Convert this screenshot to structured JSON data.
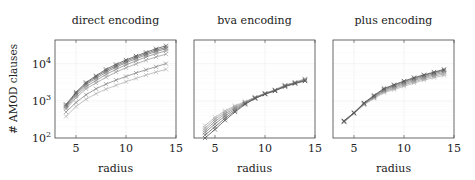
{
  "chart_data": [
    {
      "type": "line",
      "title": "direct encoding",
      "xlabel": "radius",
      "ylabel": "# AMOD clauses",
      "yscale": "log",
      "xlim": [
        2.9,
        15
      ],
      "ylim": [
        100,
        43000
      ],
      "xticks": [
        5,
        10,
        15
      ],
      "yticks": [
        100,
        1000,
        10000
      ],
      "ytick_labels": [
        "10",
        "10",
        "10"
      ],
      "ytick_exponents": [
        "2",
        "3",
        "4"
      ],
      "grid": true,
      "marker": "x",
      "x": [
        4,
        5,
        6,
        7,
        8,
        9,
        10,
        11,
        12,
        13,
        14
      ],
      "series": [
        {
          "name": "s1",
          "color": "#555555",
          "values": [
            800,
            1700,
            3100,
            4700,
            7000,
            9500,
            12500,
            16000,
            20000,
            25000,
            30000
          ]
        },
        {
          "name": "s2",
          "color": "#6a6a6a",
          "values": [
            750,
            1600,
            2900,
            4400,
            6400,
            8700,
            11500,
            14800,
            18500,
            23000,
            27000
          ]
        },
        {
          "name": "s3",
          "color": "#7d7d7d",
          "values": [
            700,
            1500,
            2700,
            4000,
            5800,
            8000,
            10500,
            13500,
            17000,
            21000,
            25000
          ]
        },
        {
          "name": "s4",
          "color": "#8f8f8f",
          "values": [
            650,
            1350,
            2400,
            3500,
            5100,
            7000,
            9200,
            11800,
            15000,
            18500,
            22000
          ]
        },
        {
          "name": "s5",
          "color": "#a0a0a0",
          "values": [
            600,
            1200,
            2100,
            3000,
            4300,
            5900,
            7700,
            9800,
            12300,
            15000,
            18000
          ]
        },
        {
          "name": "s6",
          "color": "#8a8a8a",
          "values": [
            500,
            900,
            1450,
            2100,
            2800,
            3600,
            4500,
            5600,
            6800,
            8200,
            10000
          ]
        },
        {
          "name": "s7",
          "color": "#b4b4b4",
          "values": [
            380,
            700,
            1100,
            1550,
            2050,
            2600,
            3250,
            4000,
            4900,
            5900,
            7000
          ]
        }
      ]
    },
    {
      "type": "line",
      "title": "bva encoding",
      "xlabel": "radius",
      "ylabel": "",
      "yscale": "log",
      "xlim": [
        2.9,
        15
      ],
      "ylim": [
        100,
        43000
      ],
      "xticks": [
        5,
        10,
        15
      ],
      "yticks": [
        100,
        1000,
        10000
      ],
      "grid": true,
      "marker": "x",
      "x": [
        4,
        5,
        6,
        7,
        8,
        9,
        10,
        11,
        12,
        13,
        14
      ],
      "series": [
        {
          "name": "s1",
          "color": "#555555",
          "values": [
            100,
            170,
            300,
            500,
            800,
            1150,
            1500,
            1850,
            2400,
            2900,
            3400
          ]
        },
        {
          "name": "s2",
          "color": "#6a6a6a",
          "values": [
            120,
            200,
            340,
            540,
            830,
            1170,
            1520,
            1880,
            2450,
            2950,
            3500
          ]
        },
        {
          "name": "s3",
          "color": "#7d7d7d",
          "values": [
            140,
            240,
            390,
            590,
            860,
            1190,
            1540,
            1900,
            2500,
            3000,
            3600
          ]
        },
        {
          "name": "s4",
          "color": "#8f8f8f",
          "values": [
            160,
            280,
            440,
            640,
            890,
            1210,
            1560,
            1920,
            2550,
            3050,
            3700
          ]
        },
        {
          "name": "s5",
          "color": "#a0a0a0",
          "values": [
            185,
            320,
            490,
            690,
            920,
            1230,
            1580,
            1950,
            2600,
            3100,
            3800
          ]
        },
        {
          "name": "s6",
          "color": "#b4b4b4",
          "values": [
            215,
            360,
            540,
            740,
            950,
            1250,
            1600,
            1970,
            2650,
            3150,
            3900
          ]
        }
      ]
    },
    {
      "type": "line",
      "title": "plus encoding",
      "xlabel": "radius",
      "ylabel": "",
      "yscale": "log",
      "xlim": [
        2.9,
        15
      ],
      "ylim": [
        100,
        43000
      ],
      "xticks": [
        5,
        10,
        15
      ],
      "yticks": [
        100,
        1000,
        10000
      ],
      "grid": true,
      "marker": "x",
      "x": [
        4,
        5,
        6,
        7,
        8,
        9,
        10,
        11,
        12,
        13,
        14
      ],
      "series": [
        {
          "name": "s1",
          "color": "#555555",
          "values": [
            290,
            480,
            880,
            1400,
            2150,
            2700,
            3400,
            4200,
            5000,
            5900,
            7000
          ]
        },
        {
          "name": "s2",
          "color": "#6a6a6a",
          "values": [
            285,
            475,
            860,
            1350,
            2050,
            2600,
            3250,
            4000,
            4800,
            5650,
            6700
          ]
        },
        {
          "name": "s3",
          "color": "#7d7d7d",
          "values": [
            280,
            470,
            840,
            1300,
            1950,
            2450,
            3050,
            3750,
            4500,
            5300,
            6300
          ]
        },
        {
          "name": "s4",
          "color": "#8f8f8f",
          "values": [
            275,
            465,
            820,
            1250,
            1850,
            2300,
            2850,
            3500,
            4200,
            4950,
            5800
          ]
        },
        {
          "name": "s5",
          "color": "#a0a0a0",
          "values": [
            270,
            460,
            800,
            1200,
            1750,
            2150,
            2650,
            3250,
            3900,
            4600,
            5300
          ]
        },
        {
          "name": "s6",
          "color": "#b4b4b4",
          "values": [
            265,
            455,
            780,
            1150,
            1650,
            2000,
            2450,
            3000,
            3600,
            4200,
            4800
          ]
        }
      ]
    }
  ]
}
